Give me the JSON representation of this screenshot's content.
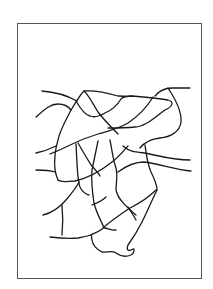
{
  "figure": {
    "type": "line-drawing",
    "frame": {
      "x": 17,
      "y": 23,
      "width": 185,
      "height": 256,
      "stroke": "#555555"
    },
    "stroke_color": "#1a1a1a",
    "background": "#ffffff"
  }
}
